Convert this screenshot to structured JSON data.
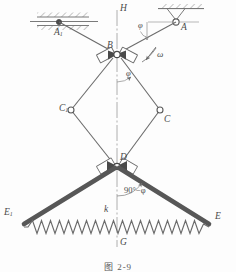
{
  "figure": {
    "caption": "图  2-9"
  },
  "labels": {
    "H": "H",
    "G": "G",
    "A": "A",
    "A1": "A",
    "A1_sub": "1",
    "B": "B",
    "C": "C",
    "C1": "C",
    "C1_sub": "1",
    "D": "D",
    "E": "E",
    "E1": "E",
    "E1_sub": "1",
    "k": "k",
    "omega": "ω",
    "phi_top": "φ",
    "phi_mid": "φ",
    "angle_bottom": "90°−φ"
  },
  "colors": {
    "line": "#6b6b6b",
    "heavy_link": "#575757",
    "joint_fill": "#ffffff",
    "joint_dark": "#4a4a4a",
    "hatch": "#7a7a7a",
    "spring": "#6b6b6b",
    "centerline": "#9a9a9a",
    "text": "#4a4a4a",
    "background": "#fdfdfd"
  },
  "geometry": {
    "centerline_x": 117,
    "ground_y": 22,
    "joint_A": [
      176,
      22
    ],
    "joint_A1": [
      59,
      22
    ],
    "joint_B": [
      117,
      54
    ],
    "joint_C1": [
      71,
      110
    ],
    "joint_C": [
      160,
      110
    ],
    "joint_D": [
      117,
      166
    ],
    "joint_E1": [
      22,
      224
    ],
    "joint_E": [
      211,
      224
    ],
    "spring_y": 227,
    "spring_zigzags": 21
  },
  "elements": {
    "support_A_type": "pin-support-triangle-ceiling",
    "support_A1_type": "roller-slider-horizontal-track",
    "spring_type": "coil-spring-zigzag",
    "link_BD_type": "slider-block-pair",
    "heavy_links": [
      "D-E",
      "D-E1"
    ]
  }
}
